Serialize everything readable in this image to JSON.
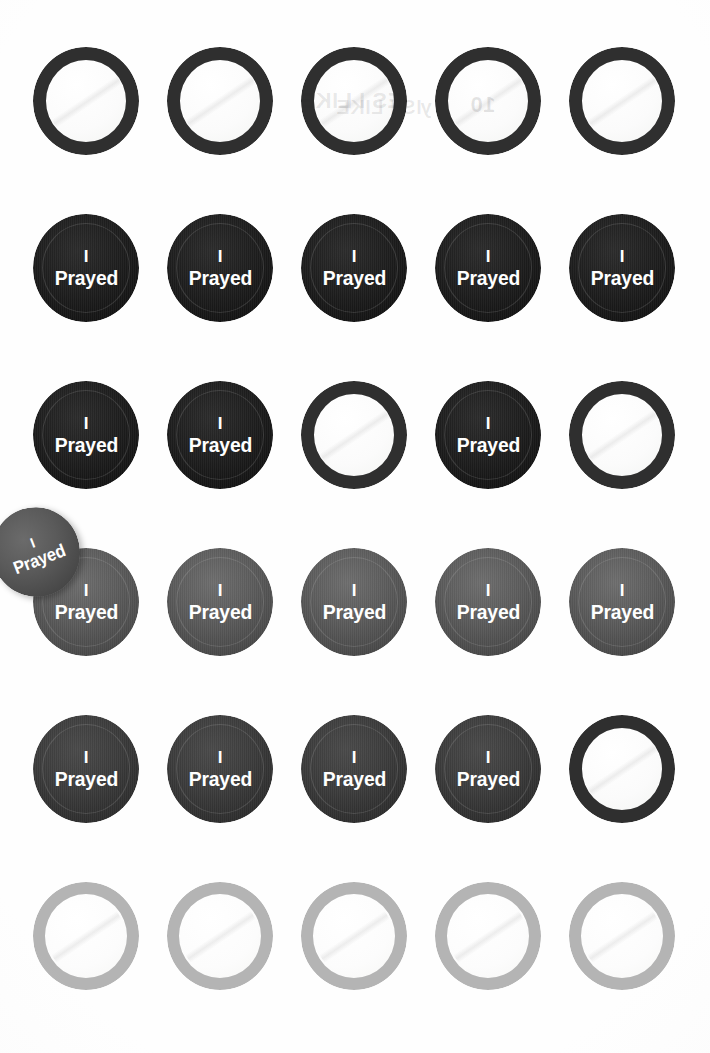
{
  "sheet": {
    "title": "I Prayed button sheet",
    "background_color": "#fefefe",
    "columns": 5,
    "rows": 6,
    "grid_left": 33,
    "grid_top": 47,
    "col_step": 134,
    "row_step": 167,
    "pin_size": 106
  },
  "button_label": {
    "line1": "I",
    "line2": "Prayed",
    "text_color": "#ffffff"
  },
  "colors": {
    "ink_black": "#1a1a1a",
    "ink_dark": "#242424",
    "ink_charcoal": "#383838",
    "ink_gray": "#585858",
    "ring_dark": "#2f2f2f",
    "ring_light": "#b4b4b4",
    "blank_face": "#fbfbfb",
    "paper": "#fefefe"
  },
  "ghost_text": [
    {
      "text": "ES I LIKE",
      "x": 300,
      "y": 88,
      "size": 22,
      "opacity": 0.11
    },
    {
      "text": "IS I LIKE",
      "x": 336,
      "y": 96,
      "size": 20,
      "opacity": 0.09
    },
    {
      "text": "y",
      "x": 420,
      "y": 96,
      "size": 20,
      "opacity": 0.1
    },
    {
      "text": "10",
      "x": 470,
      "y": 92,
      "size": 22,
      "opacity": 0.12
    }
  ],
  "rows": [
    {
      "index": 1,
      "state": "blank",
      "note": "unprinted blanks with dark ring",
      "pins": [
        {
          "col": 1,
          "state": "empty",
          "ring": "ring-dark"
        },
        {
          "col": 2,
          "state": "empty",
          "ring": "ring-dark"
        },
        {
          "col": 3,
          "state": "empty",
          "ring": "ring-dark"
        },
        {
          "col": 4,
          "state": "empty",
          "ring": "ring-dark"
        },
        {
          "col": 5,
          "state": "empty",
          "ring": "ring-dark"
        }
      ]
    },
    {
      "index": 2,
      "state": "printed",
      "note": "full row printed black",
      "pins": [
        {
          "col": 1,
          "state": "filled",
          "shade": "shade-black"
        },
        {
          "col": 2,
          "state": "filled",
          "shade": "shade-black"
        },
        {
          "col": 3,
          "state": "filled",
          "shade": "shade-black"
        },
        {
          "col": 4,
          "state": "filled",
          "shade": "shade-black"
        },
        {
          "col": 5,
          "state": "filled",
          "shade": "shade-black"
        }
      ]
    },
    {
      "index": 3,
      "state": "mixed",
      "note": "printed at 1,2,4; blank at 3,5",
      "pins": [
        {
          "col": 1,
          "state": "filled",
          "shade": "shade-black"
        },
        {
          "col": 2,
          "state": "filled",
          "shade": "shade-black"
        },
        {
          "col": 3,
          "state": "empty",
          "ring": "ring-dark"
        },
        {
          "col": 4,
          "state": "filled",
          "shade": "shade-black"
        },
        {
          "col": 5,
          "state": "empty",
          "ring": "ring-dark"
        }
      ]
    },
    {
      "index": 4,
      "state": "printed",
      "note": "full row printed mid-gray",
      "pins": [
        {
          "col": 1,
          "state": "filled",
          "shade": "shade-gray"
        },
        {
          "col": 2,
          "state": "filled",
          "shade": "shade-gray"
        },
        {
          "col": 3,
          "state": "filled",
          "shade": "shade-gray"
        },
        {
          "col": 4,
          "state": "filled",
          "shade": "shade-gray"
        },
        {
          "col": 5,
          "state": "filled",
          "shade": "shade-gray"
        }
      ]
    },
    {
      "index": 5,
      "state": "mixed",
      "note": "printed charcoal at 1-4; blank at 5",
      "pins": [
        {
          "col": 1,
          "state": "filled",
          "shade": "shade-charcoal"
        },
        {
          "col": 2,
          "state": "filled",
          "shade": "shade-charcoal"
        },
        {
          "col": 3,
          "state": "filled",
          "shade": "shade-charcoal"
        },
        {
          "col": 4,
          "state": "filled",
          "shade": "shade-charcoal"
        },
        {
          "col": 5,
          "state": "empty",
          "ring": "ring-dark"
        }
      ]
    },
    {
      "index": 6,
      "state": "blank",
      "note": "unprinted blanks with light gray ring",
      "pins": [
        {
          "col": 1,
          "state": "empty",
          "ring": "ring-light"
        },
        {
          "col": 2,
          "state": "empty",
          "ring": "ring-light"
        },
        {
          "col": 3,
          "state": "empty",
          "ring": "ring-light"
        },
        {
          "col": 4,
          "state": "empty",
          "ring": "ring-light"
        },
        {
          "col": 5,
          "state": "empty",
          "ring": "ring-light"
        }
      ]
    }
  ],
  "loose_pin": {
    "present": true,
    "state": "filled",
    "shade": "shade-gray",
    "rotation_deg": -21,
    "x": -8,
    "y": 507,
    "size": 88,
    "note": "single detached button overlapping left margin between rows 3 and 4"
  }
}
